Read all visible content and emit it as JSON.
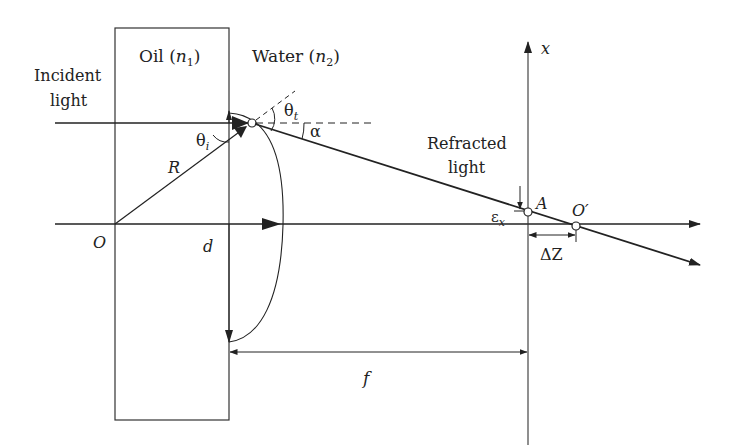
{
  "diagram": {
    "type": "optics-refraction-schematic",
    "regions": {
      "oil": {
        "name": "Oil",
        "index": "n",
        "sub": "1"
      },
      "water": {
        "name": "Water",
        "index": "n",
        "sub": "2"
      }
    },
    "labels": {
      "incident_line1": "Incident",
      "incident_line2": "light",
      "refracted_line1": "Refracted",
      "refracted_line2": "light",
      "theta_i": "θ",
      "theta_i_sub": "i",
      "theta_t": "θ",
      "theta_t_sub": "t",
      "alpha": "α",
      "radius": "R",
      "origin": "O",
      "d": "d",
      "x_axis": "x",
      "point_a": "A",
      "point_o_prime": "O′",
      "epsilon": "ε",
      "epsilon_sub": "x",
      "delta_z": "ΔZ",
      "focal": "f"
    },
    "colors": {
      "ink": "#222222",
      "background": "#ffffff"
    }
  }
}
